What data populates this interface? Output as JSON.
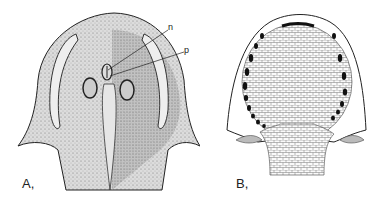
{
  "figure": {
    "panels": [
      {
        "id": "A",
        "label": "A,",
        "description": "Stippled drawing of head shield (dorsal view) with orbits, pineal and nasal openings and lateral sensory fields",
        "annotations": [
          {
            "text": "n"
          },
          {
            "text": "p"
          }
        ]
      },
      {
        "id": "B",
        "label": "B,",
        "description": "Line drawing of head shield showing polygonal tesserae mosaic and marginal dark openings"
      }
    ]
  }
}
